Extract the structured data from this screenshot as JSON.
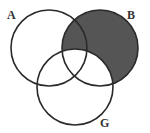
{
  "diagram": {
    "type": "venn",
    "sets": [
      {
        "label": "A",
        "cx": 49,
        "cy": 48,
        "r": 38
      },
      {
        "label": "B",
        "cx": 100,
        "cy": 48,
        "r": 38
      },
      {
        "label": "G",
        "cx": 75,
        "cy": 87,
        "r": 38
      }
    ],
    "shaded_region": "B minus G",
    "colors": {
      "stroke": "#2a2a2a",
      "shade": "#555555",
      "background": "#ffffff"
    }
  },
  "labels": {
    "a": "A",
    "b": "B",
    "g": "G"
  }
}
